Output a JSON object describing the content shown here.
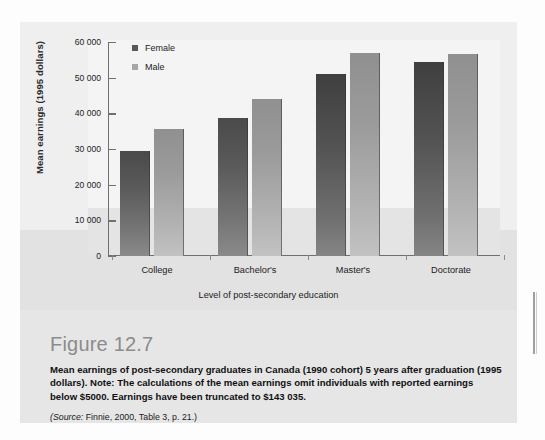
{
  "figure": {
    "title": "Figure 12.7",
    "description": "Mean earnings of post-secondary graduates in Canada (1990 cohort) 5 years after graduation (1995 dollars). Note: The calculations of the mean earnings omit individuals with reported earnings below $5000. Earnings have been truncated to $143 035.",
    "source_prefix": "(Source:",
    "source_text": " Finnie, 2000, Table 3, p. 21.)"
  },
  "colors": {
    "female_bar": "#5a5a5a",
    "male_bar": "#a7a7a7",
    "axis": "#6f6f6f",
    "panel_bg": "#efefef",
    "plot_bg": "#f4f4f4",
    "title_gray": "#8b8b8b"
  },
  "chart_data": {
    "type": "bar",
    "title": "",
    "xlabel": "Level of post-secondary education",
    "ylabel": "Mean earnings (1995 dollars)",
    "categories": [
      "College",
      "Bachelor's",
      "Master's",
      "Doctorate"
    ],
    "ylim": [
      0,
      60000
    ],
    "yticks": [
      0,
      10000,
      20000,
      30000,
      40000,
      50000,
      60000
    ],
    "ytick_labels": [
      "0",
      "10 000",
      "20 000",
      "30 000",
      "40 000",
      "50 000",
      "60 000"
    ],
    "grid": false,
    "legend_position": "top-left",
    "series": [
      {
        "name": "Female",
        "values": [
          29500,
          38700,
          51000,
          54300
        ]
      },
      {
        "name": "Male",
        "values": [
          35500,
          44000,
          57000,
          56500
        ]
      }
    ]
  }
}
